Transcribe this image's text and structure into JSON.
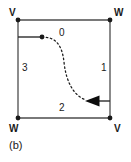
{
  "figure": {
    "caption": "(b)",
    "colors": {
      "stroke": "#4d4d4d",
      "node": "#1a1a1a",
      "curve": "#1a1a1a",
      "text": "#1a1a1a",
      "background": "#ffffff"
    }
  },
  "square": {
    "vertices": [
      {
        "id": "top-left",
        "label": "V"
      },
      {
        "id": "top-right",
        "label": "W"
      },
      {
        "id": "bottom-left",
        "label": "W"
      },
      {
        "id": "bottom-right",
        "label": "V"
      }
    ],
    "edges": [
      {
        "id": "top",
        "label": "0"
      },
      {
        "id": "right",
        "label": "1"
      },
      {
        "id": "bottom",
        "label": "2"
      },
      {
        "id": "left",
        "label": "3"
      }
    ]
  },
  "annotation": {
    "start_marker": "start-dot",
    "end_marker": "arrowhead-left",
    "path_style": "dashed-s-curve"
  }
}
